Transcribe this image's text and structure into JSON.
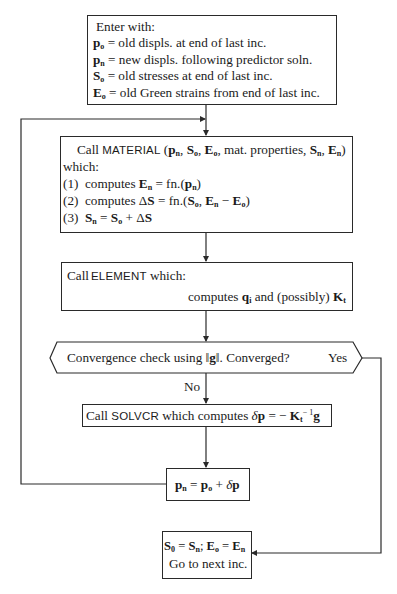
{
  "flowchart": {
    "entry_box": {
      "title": "Enter with:",
      "lines": [
        {
          "symbol": "p",
          "sub": "o",
          "text": "= old displs. at end of last inc."
        },
        {
          "symbol": "p",
          "sub": "n",
          "text": "= new displs. following predictor soln."
        },
        {
          "symbol": "S",
          "sub": "o",
          "text": "= old stresses at end of last inc."
        },
        {
          "symbol": "E",
          "sub": "o",
          "text": "= old Green strains from end of last inc."
        }
      ]
    },
    "material_box": {
      "call_prefix": "Call",
      "routine": "MATERIAL",
      "args": "(pn, So, Eo, mat. properties, Sn, En)",
      "which": "which:",
      "steps": [
        {
          "num": "(1)",
          "text": "computes",
          "expr": "En = fn.(pn)"
        },
        {
          "num": "(2)",
          "text": "computes",
          "expr": "ΔS = fn.(So, En − Eo)"
        },
        {
          "num": "(3)",
          "text": "",
          "expr": "Sn = So + ΔS"
        }
      ]
    },
    "element_box": {
      "call_prefix": "Call",
      "routine": "ELEMENT",
      "which": "which:",
      "computes": "computes",
      "q_symbol": "q",
      "q_sub": "i",
      "middle": "and (possibly)",
      "k_symbol": "K",
      "k_sub": "t"
    },
    "decision": {
      "text_before": "Convergence check using",
      "norm_symbol": "g",
      "text_after": ". Converged?",
      "yes_label": "Yes",
      "no_label": "No"
    },
    "solver_box": {
      "call_prefix": "Call",
      "routine": "SOLVCR",
      "text": "which computes",
      "expr": "δp = − Kt⁻¹ g"
    },
    "update_box": {
      "expr": "pn = po + δp"
    },
    "final_box": {
      "line1": "S0 = Sn; Eo = En",
      "line2": "Go to next inc."
    }
  }
}
